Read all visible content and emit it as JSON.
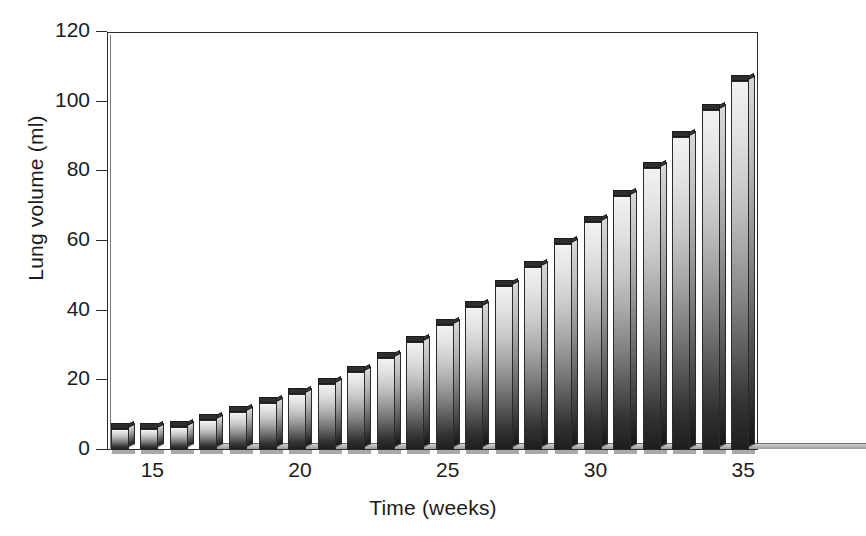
{
  "chart_data": {
    "type": "bar",
    "title": "",
    "xlabel": "Time (weeks)",
    "ylabel": "Lung volume (ml)",
    "categories": [
      14,
      15,
      16,
      17,
      18,
      19,
      20,
      21,
      22,
      23,
      24,
      25,
      26,
      27,
      28,
      29,
      30,
      31,
      32,
      33,
      34,
      35
    ],
    "values": [
      6,
      6,
      6.5,
      8.5,
      11,
      13.5,
      16,
      19,
      22.5,
      26.5,
      31,
      36,
      41,
      47,
      52.5,
      59,
      65.5,
      73,
      81,
      90,
      97.5,
      106
    ],
    "xticks": [
      15,
      20,
      25,
      30,
      35
    ],
    "yticks": [
      0,
      20,
      40,
      60,
      80,
      100,
      120
    ],
    "xlim": [
      13.5,
      35.5
    ],
    "ylim": [
      0,
      120
    ],
    "grid": false,
    "legend": null,
    "bar_style": "3d-block-gradient",
    "bar_color_top": "#f2f2f2",
    "bar_color_bottom": "#1e1e1e",
    "axis_color": "#2b2b2b",
    "background": "#ffffff"
  },
  "axes": {
    "y_tick_labels": [
      "120",
      "100",
      "80",
      "60",
      "40",
      "20",
      "0"
    ],
    "x_tick_labels": [
      "15",
      "20",
      "25",
      "30",
      "35"
    ]
  }
}
